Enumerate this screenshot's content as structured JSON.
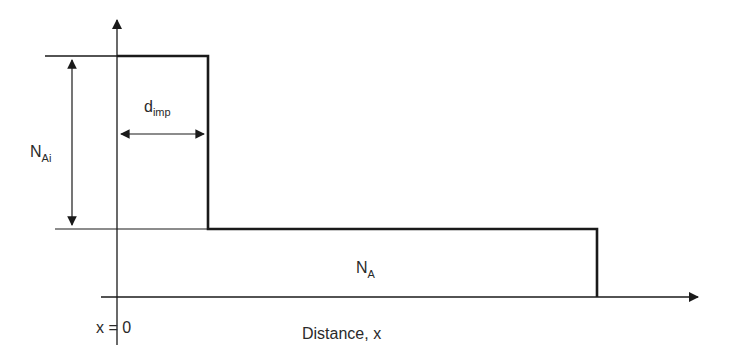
{
  "diagram": {
    "type": "doping-profile",
    "labels": {
      "implant_conc_main": "N",
      "implant_conc_sub": "Ai",
      "implant_depth_main": "d",
      "implant_depth_sub": "imp",
      "background_conc_main": "N",
      "background_conc_sub": "A",
      "origin": "x = 0",
      "x_axis": "Distance, x"
    },
    "regions": [
      {
        "name": "implanted-layer",
        "from": "x = 0",
        "to": "d_imp",
        "level": "N_Ai"
      },
      {
        "name": "substrate",
        "from": "d_imp",
        "level": "N_A"
      }
    ],
    "colors": {
      "line": "#1a1a1a",
      "text": "#2a2a2a",
      "background": "#ffffff"
    }
  }
}
